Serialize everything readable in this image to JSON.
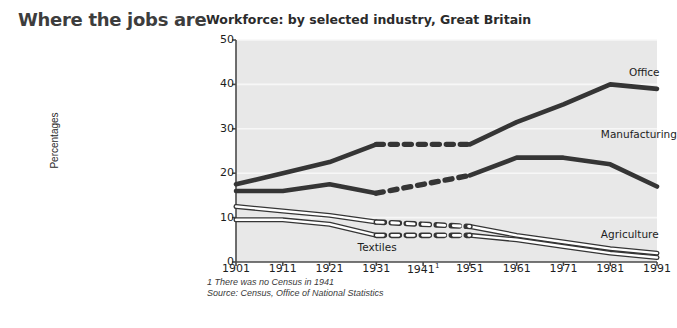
{
  "headline": "Where the jobs are",
  "subtitle": "Workforce: by selected industry, Great Britain",
  "footnote": "1 There was no Census in 1941",
  "source": "Source: Census, Office of National Statistics",
  "colors": {
    "plot_background": "#e8e8e8",
    "gridline": "#f7f7f7",
    "axis": "#4a4a4a",
    "dark_series": "#353535",
    "light_series_fill": "#ffffff",
    "light_series_stroke": "#353535",
    "headline_text": "#3d3d3d",
    "body_text": "#1d1d1d"
  },
  "chart_data": {
    "type": "line",
    "title": "Workforce: by selected industry, Great Britain",
    "xlabel": "",
    "ylabel": "Percentages",
    "ylim": [
      0,
      50
    ],
    "yticks": [
      0,
      10,
      20,
      30,
      40,
      50
    ],
    "grid": true,
    "legend": "inline-right",
    "x": [
      1901,
      1911,
      1921,
      1931,
      1941,
      1951,
      1961,
      1971,
      1981,
      1991
    ],
    "xtick_labels": [
      "1901",
      "1911",
      "1921",
      "1931",
      "1941",
      "1951",
      "1961",
      "1971",
      "1981",
      "1991"
    ],
    "xtick_footnote_index": 4,
    "gap_segment": {
      "from": 1931,
      "to": 1951,
      "style": "dashed",
      "reason": "no Census in 1941"
    },
    "series": [
      {
        "name": "Office",
        "style": "solid-dark",
        "label_x": 1985,
        "label_y": 42.5,
        "values": [
          17.5,
          20.0,
          22.5,
          26.5,
          null,
          26.5,
          31.5,
          35.5,
          40.0,
          39.0
        ]
      },
      {
        "name": "Manufacturing",
        "style": "solid-dark",
        "label_x": 1979,
        "label_y": 28.5,
        "values": [
          16.0,
          16.0,
          17.5,
          15.5,
          null,
          19.5,
          23.5,
          23.5,
          22.0,
          17.0
        ]
      },
      {
        "name": "Agriculture",
        "style": "outline-light",
        "label_x": 1979,
        "label_y": 6.0,
        "values": [
          12.5,
          11.5,
          10.5,
          9.0,
          null,
          8.0,
          6.0,
          4.5,
          3.0,
          2.0
        ]
      },
      {
        "name": "Textiles",
        "style": "outline-light",
        "label_x": 1927,
        "label_y": 3.2,
        "values": [
          9.5,
          9.5,
          8.5,
          6.0,
          null,
          6.0,
          5.0,
          3.5,
          2.0,
          1.0
        ]
      }
    ]
  }
}
